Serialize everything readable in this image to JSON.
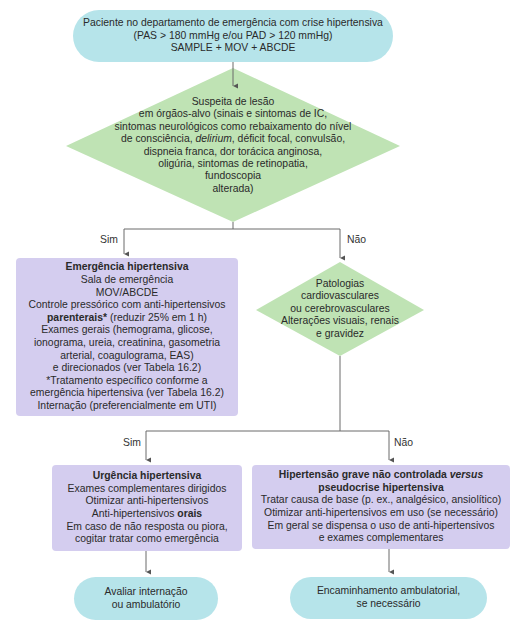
{
  "start": {
    "lines": [
      "Paciente no departamento de emergência com crise hipertensiva",
      "(PAS > 180 mmHg e/ou PAD > 120 mmHg)",
      "SAMPLE + MOV + ABCDE"
    ]
  },
  "decision1": {
    "lines": [
      "Suspeita de lesão",
      "em órgãos-alvo (sinais e sintomas de IC,",
      "sintomas neurológicos como rebaixamento do nível",
      "de consciência,",
      "delirium",
      ", déficit focal, convulsão,",
      "dispneia franca, dor torácica anginosa,",
      "oligúria, sintomas de retinopatia,",
      "fundoscopia",
      "alterada)"
    ],
    "yes_label": "Sim",
    "no_label": "Não"
  },
  "emergency": {
    "title": "Emergência hipertensiva",
    "lines": [
      "Sala de emergência",
      "MOV/ABCDE",
      "Controle pressórico com anti-hipertensivos"
    ],
    "bold_word": "parenterais*",
    "after_bold": " (reduzir 25% em 1 h)",
    "lines2": [
      "Exames gerais (hemograma, glicose,",
      "ionograma, ureia, creatinina, gasometria",
      "arterial, coagulograma, EAS)",
      "e direcionados (ver Tabela 16.2)",
      "*Tratamento específico conforme a",
      "emergência hipertensiva (ver Tabela 16.2)",
      "Internação (preferencialmente em UTI)"
    ]
  },
  "decision2": {
    "lines": [
      "Patologias",
      "cardiovasculares",
      "ou cerebrovasculares",
      "Alterações visuais, renais",
      "e gravidez"
    ],
    "yes_label": "Sim",
    "no_label": "Não"
  },
  "urgency": {
    "title": "Urgência hipertensiva",
    "lines": [
      "Exames complementares dirigidos",
      "Otimizar anti-hipertensivos"
    ],
    "line3_prefix": "Anti-hipertensivos ",
    "line3_bold": "orais",
    "lines2": [
      "Em caso de não resposta ou piora,",
      "cogitar tratar como emergência"
    ]
  },
  "severe": {
    "title_prefix": "Hipertensão grave não controlada ",
    "title_italic": "versus",
    "title_line2": "pseudocrise hipertensiva",
    "lines": [
      "Tratar causa de base (p. ex., analgésico, ansiolítico)",
      "Otimizar anti-hipertensivos em uso (se necessário)",
      "Em geral se dispensa o uso de anti-hipertensivos",
      "e exames complementares"
    ]
  },
  "end_left": {
    "lines": [
      "Avaliar internação",
      "ou ambulatório"
    ]
  },
  "end_right": {
    "lines": [
      "Encaminhamento ambulatorial,",
      "se necessário"
    ]
  },
  "colors": {
    "terminal": "#b6e4ea",
    "decision": "#bfe3b4",
    "process": "#d4cdef",
    "connector": "#6b6b6b"
  }
}
